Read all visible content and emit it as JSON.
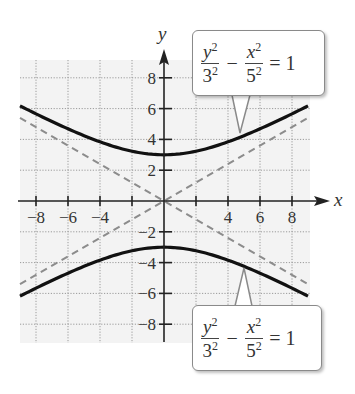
{
  "chart_data": {
    "type": "line",
    "title": "",
    "xlabel": "x",
    "ylabel": "y",
    "xlim": [
      -9,
      9
    ],
    "ylim": [
      -9,
      9
    ],
    "grid": true,
    "grid_spacing": 2,
    "x_ticks": [
      -8,
      -6,
      -4,
      -2,
      2,
      4,
      6,
      8
    ],
    "x_tick_labels": [
      "−8",
      "−6",
      "−4",
      "4",
      "6",
      "8"
    ],
    "y_ticks": [
      -8,
      -6,
      -4,
      -2,
      2,
      4,
      6,
      8
    ],
    "y_tick_labels": [
      "8",
      "6",
      "4",
      "2",
      "−2",
      "−4",
      "−6",
      "−8"
    ],
    "series": [
      {
        "name": "hyperbola upper branch",
        "equation": "y = 3*sqrt(1 + x^2/25)",
        "style": "solid",
        "color": "#111111",
        "x": [
          -9,
          -8,
          -6,
          -4,
          -2,
          0,
          2,
          4,
          6,
          8,
          9
        ],
        "y": [
          6.18,
          5.66,
          4.69,
          3.84,
          3.23,
          3,
          3.23,
          3.84,
          4.69,
          5.66,
          6.18
        ]
      },
      {
        "name": "hyperbola lower branch",
        "equation": "y = -3*sqrt(1 + x^2/25)",
        "style": "solid",
        "color": "#111111",
        "x": [
          -9,
          -8,
          -6,
          -4,
          -2,
          0,
          2,
          4,
          6,
          8,
          9
        ],
        "y": [
          -6.18,
          -5.66,
          -4.69,
          -3.84,
          -3.23,
          -3,
          -3.23,
          -3.84,
          -4.69,
          -5.66,
          -6.18
        ]
      },
      {
        "name": "asymptote y = 3x/5",
        "style": "dashed",
        "color": "#888888",
        "x": [
          -9,
          9
        ],
        "y": [
          -5.4,
          5.4
        ]
      },
      {
        "name": "asymptote y = -3x/5",
        "style": "dashed",
        "color": "#888888",
        "x": [
          -9,
          9
        ],
        "y": [
          5.4,
          -5.4
        ]
      }
    ],
    "annotations": [
      {
        "text": "y^2/3^2 - x^2/5^2 = 1",
        "points_to": "upper branch",
        "position": "top-right"
      },
      {
        "text": "y^2/3^2 - x^2/5^2 = 1",
        "points_to": "lower branch",
        "position": "bottom-right"
      }
    ]
  },
  "axes": {
    "x_label": "x",
    "y_label": "y"
  },
  "callouts": {
    "upper": {
      "num_var": "y",
      "num_exp": "2",
      "den1_base": "3",
      "den1_exp": "2",
      "minus": "−",
      "num2_var": "x",
      "num2_exp": "2",
      "den2_base": "5",
      "den2_exp": "2",
      "rhs": "= 1"
    },
    "lower": {
      "num_var": "y",
      "num_exp": "2",
      "den1_base": "3",
      "den1_exp": "2",
      "minus": "−",
      "num2_var": "x",
      "num2_exp": "2",
      "den2_base": "5",
      "den2_exp": "2",
      "rhs": "= 1"
    }
  }
}
